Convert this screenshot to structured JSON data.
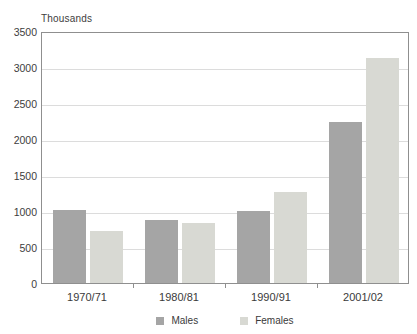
{
  "chart_data": {
    "type": "bar",
    "title": "Thousands",
    "categories": [
      "1970/71",
      "1980/81",
      "1990/91",
      "2001/02"
    ],
    "series": [
      {
        "name": "Males",
        "color": "#a5a5a5",
        "values": [
          1010,
          870,
          1000,
          2240
        ]
      },
      {
        "name": "Females",
        "color": "#d8d9d3",
        "values": [
          720,
          830,
          1260,
          3120
        ]
      }
    ],
    "xlabel": "",
    "ylabel": "Thousands",
    "ylim": [
      0,
      3500
    ],
    "yticks": [
      0,
      500,
      1000,
      1500,
      2000,
      2500,
      3000,
      3500
    ],
    "grid": true,
    "legend_position": "bottom"
  },
  "colors": {
    "plot_border": "#8f8f8f",
    "gridline": "#dcdcdc",
    "text": "#3d3d3d",
    "background": "#ffffff"
  }
}
